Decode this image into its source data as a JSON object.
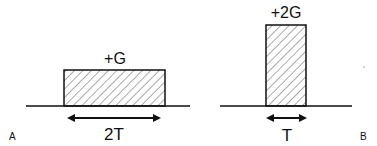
{
  "panels": [
    {
      "id": "A",
      "label": "A",
      "pulse_label": "+G",
      "duration_label": "2T",
      "amplitude": 1,
      "duration": 2
    },
    {
      "id": "B",
      "label": "B",
      "pulse_label": "+2G",
      "duration_label": "T",
      "amplitude": 2,
      "duration": 1
    }
  ],
  "colors": {
    "stroke": "#111111",
    "hatch": "#444444",
    "background": "#ffffff"
  }
}
